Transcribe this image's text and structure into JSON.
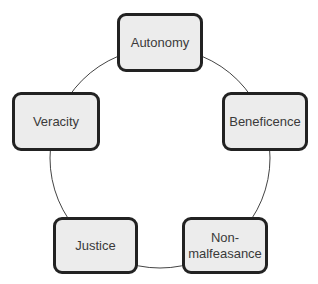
{
  "diagram": {
    "type": "cycle",
    "nodes": [
      {
        "label": "Autonomy"
      },
      {
        "label": "Beneficence"
      },
      {
        "label": "Non-\nmalfeasance"
      },
      {
        "label": "Justice"
      },
      {
        "label": "Veracity"
      }
    ],
    "colors": {
      "box_fill": "#ececec",
      "box_border": "#222222",
      "ring": "#444444"
    }
  }
}
